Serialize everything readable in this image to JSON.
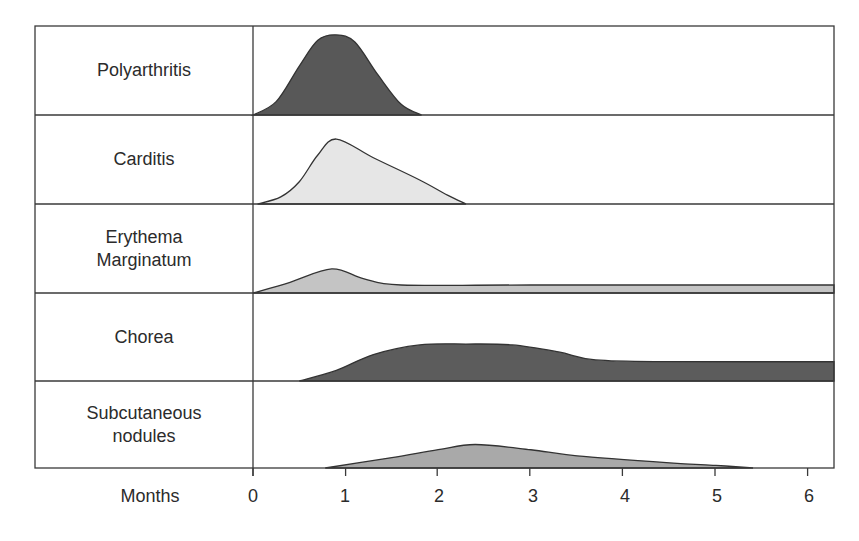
{
  "chart_data": {
    "type": "area",
    "title": "",
    "xlabel": "Months",
    "ylabel": "",
    "x_ticks": [
      0,
      1,
      2,
      3,
      4,
      5,
      6
    ],
    "xlim": [
      0,
      6.3
    ],
    "grid": false,
    "legend": "none (row labels on left)",
    "layout": "stacked ridge rows, one per manifestation; y = relative intensity within row (0-1)",
    "series": [
      {
        "name": "Polyarthritis",
        "fill": "#585858",
        "points": [
          [
            0.0,
            0.0
          ],
          [
            0.25,
            0.15
          ],
          [
            0.5,
            0.55
          ],
          [
            0.7,
            0.84
          ],
          [
            0.9,
            0.9
          ],
          [
            1.1,
            0.82
          ],
          [
            1.35,
            0.45
          ],
          [
            1.6,
            0.12
          ],
          [
            1.82,
            0.0
          ]
        ]
      },
      {
        "name": "Carditis",
        "fill": "#e6e6e6",
        "points": [
          [
            0.05,
            0.0
          ],
          [
            0.3,
            0.08
          ],
          [
            0.5,
            0.25
          ],
          [
            0.7,
            0.55
          ],
          [
            0.9,
            0.73
          ],
          [
            1.3,
            0.52
          ],
          [
            1.8,
            0.27
          ],
          [
            2.1,
            0.1
          ],
          [
            2.3,
            0.0
          ]
        ]
      },
      {
        "name": "Erythema Marginatum",
        "fill": "#c4c4c4",
        "points": [
          [
            0.0,
            0.0
          ],
          [
            0.4,
            0.12
          ],
          [
            0.85,
            0.27
          ],
          [
            1.2,
            0.16
          ],
          [
            1.6,
            0.09
          ],
          [
            3.0,
            0.09
          ],
          [
            6.3,
            0.09
          ]
        ]
      },
      {
        "name": "Chorea",
        "fill": "#5c5c5c",
        "points": [
          [
            0.5,
            0.0
          ],
          [
            0.9,
            0.12
          ],
          [
            1.3,
            0.3
          ],
          [
            1.8,
            0.41
          ],
          [
            2.3,
            0.42
          ],
          [
            2.8,
            0.41
          ],
          [
            3.3,
            0.33
          ],
          [
            3.7,
            0.24
          ],
          [
            4.5,
            0.22
          ],
          [
            6.3,
            0.22
          ]
        ]
      },
      {
        "name": "Subcutaneous nodules",
        "fill": "#a9a9a9",
        "points": [
          [
            0.78,
            0.0
          ],
          [
            1.5,
            0.12
          ],
          [
            2.0,
            0.21
          ],
          [
            2.4,
            0.27
          ],
          [
            3.0,
            0.21
          ],
          [
            3.5,
            0.14
          ],
          [
            4.5,
            0.06
          ],
          [
            5.0,
            0.03
          ],
          [
            5.4,
            0.0
          ]
        ]
      }
    ]
  },
  "rows": [
    {
      "label": "Polyarthritis"
    },
    {
      "label": "Carditis"
    },
    {
      "label": "Erythema\nMarginatum"
    },
    {
      "label": "Chorea"
    },
    {
      "label": "Subcutaneous\nnodules"
    }
  ],
  "axis": {
    "title": "Months",
    "ticks": [
      "0",
      "1",
      "2",
      "3",
      "4",
      "5",
      "6"
    ]
  }
}
